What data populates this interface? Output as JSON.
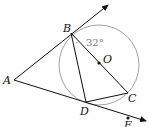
{
  "diagram": {
    "type": "geometry",
    "points": {
      "A": {
        "label": "A",
        "x": 14,
        "y": 80
      },
      "B": {
        "label": "B",
        "x": 71,
        "y": 33
      },
      "C": {
        "label": "C",
        "x": 128,
        "y": 93
      },
      "D": {
        "label": "D",
        "x": 86,
        "y": 102
      },
      "O": {
        "label": "O",
        "x": 99,
        "y": 63
      },
      "E": {
        "label": "E",
        "x": 128,
        "y": 118
      }
    },
    "circle": {
      "center": "O",
      "cx": 99,
      "cy": 65,
      "r": 40,
      "color": "#999999"
    },
    "angle_label": "32°",
    "colors": {
      "line": "#111111",
      "circle": "#999999",
      "angle_text": "#777777"
    }
  }
}
